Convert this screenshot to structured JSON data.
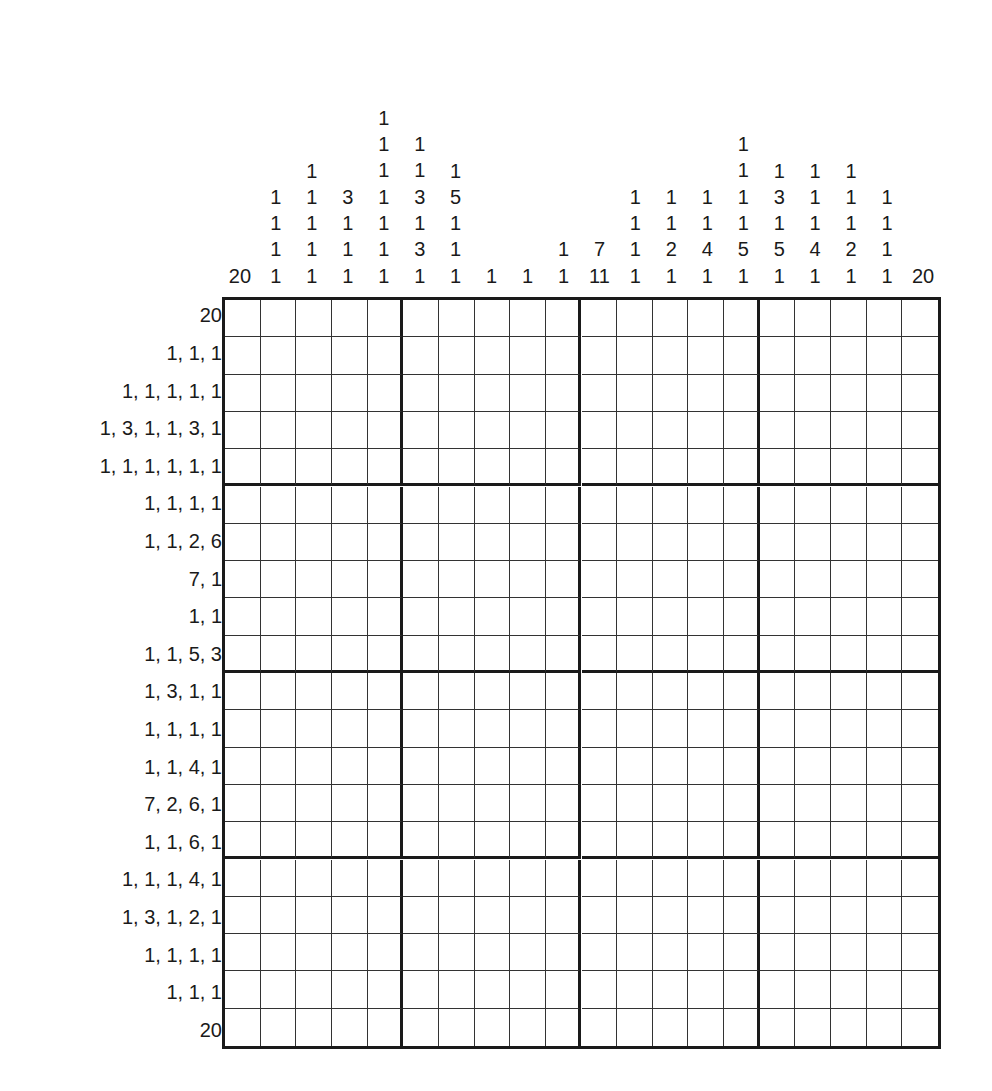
{
  "puzzle": {
    "type": "nonogram",
    "size": {
      "cols": 20,
      "rows": 20
    },
    "column_clues": [
      [
        20
      ],
      [
        1,
        1,
        1,
        1
      ],
      [
        1,
        1,
        1,
        1,
        1
      ],
      [
        3,
        1,
        1,
        1
      ],
      [
        1,
        1,
        1,
        1,
        1,
        1,
        1
      ],
      [
        1,
        1,
        3,
        1,
        3,
        1
      ],
      [
        1,
        5,
        1,
        1,
        1
      ],
      [
        1
      ],
      [
        1
      ],
      [
        1,
        1
      ],
      [
        7,
        11
      ],
      [
        1,
        1,
        1,
        1
      ],
      [
        1,
        1,
        2,
        1
      ],
      [
        1,
        1,
        4,
        1
      ],
      [
        1,
        1,
        1,
        1,
        5,
        1
      ],
      [
        1,
        3,
        1,
        5,
        1
      ],
      [
        1,
        1,
        1,
        4,
        1
      ],
      [
        1,
        1,
        1,
        2,
        1
      ],
      [
        1,
        1,
        1,
        1
      ],
      [
        20
      ]
    ],
    "row_clues": [
      "20",
      "1, 1, 1",
      "1, 1, 1, 1, 1",
      "1, 3, 1, 1, 3, 1",
      "1, 1, 1, 1, 1, 1",
      "1, 1, 1, 1",
      "1, 1, 2, 6",
      "7, 1",
      "1, 1",
      "1, 1, 5, 3",
      "1, 3, 1, 1",
      "1, 1, 1, 1",
      "1, 1, 4, 1",
      "7, 2, 6, 1",
      "1, 1, 6, 1",
      "1, 1, 1, 4, 1",
      "1, 3, 1, 2, 1",
      "1, 1, 1, 1",
      "1, 1, 1",
      "20"
    ],
    "colors": {
      "ink": "#1a1a1a",
      "background": "#ffffff"
    }
  }
}
